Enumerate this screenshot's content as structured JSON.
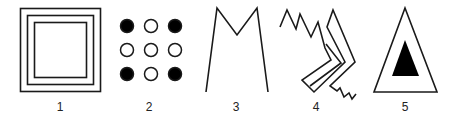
{
  "figures": [
    {
      "id": 1,
      "label": "1",
      "description": "three nested squares"
    },
    {
      "id": 2,
      "label": "2",
      "description": "3x3 grid of circles; corner circles filled, others hollow",
      "grid": [
        [
          "filled",
          "hollow",
          "filled"
        ],
        [
          "hollow",
          "hollow",
          "hollow"
        ],
        [
          "filled",
          "hollow",
          "filled"
        ]
      ]
    },
    {
      "id": 3,
      "label": "3",
      "description": "open M-shaped polyline"
    },
    {
      "id": 4,
      "label": "4",
      "description": "zigzag lines with chevron-shaped band"
    },
    {
      "id": 5,
      "label": "5",
      "description": "outlined triangle containing a filled triangle"
    }
  ],
  "colors": {
    "line": "#1a1a1a",
    "fill": "#000000",
    "background": "#ffffff"
  }
}
